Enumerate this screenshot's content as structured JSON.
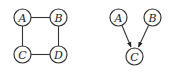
{
  "diagrams": [
    {
      "name": "undirected-square",
      "type": "undirected",
      "nodes": [
        {
          "id": "A",
          "label": "A",
          "x": 22.5,
          "y": 17.5
        },
        {
          "id": "B",
          "label": "B",
          "x": 58.5,
          "y": 17.5
        },
        {
          "id": "C",
          "label": "C",
          "x": 22.5,
          "y": 54.5
        },
        {
          "id": "D",
          "label": "D",
          "x": 58.5,
          "y": 54.5
        }
      ],
      "edges": [
        {
          "from": "A",
          "to": "B"
        },
        {
          "from": "B",
          "to": "D"
        },
        {
          "from": "D",
          "to": "C"
        },
        {
          "from": "C",
          "to": "A"
        }
      ]
    },
    {
      "name": "directed-v-structure",
      "type": "directed",
      "nodes": [
        {
          "id": "A",
          "label": "A",
          "x": 118.5,
          "y": 17.5
        },
        {
          "id": "B",
          "label": "B",
          "x": 152.5,
          "y": 17.5
        },
        {
          "id": "C",
          "label": "C",
          "x": 134.5,
          "y": 56.5
        }
      ],
      "edges": [
        {
          "from": "A",
          "to": "C"
        },
        {
          "from": "B",
          "to": "C"
        }
      ]
    }
  ],
  "colors": {
    "stroke": "#333333",
    "background": "#ffffff"
  }
}
